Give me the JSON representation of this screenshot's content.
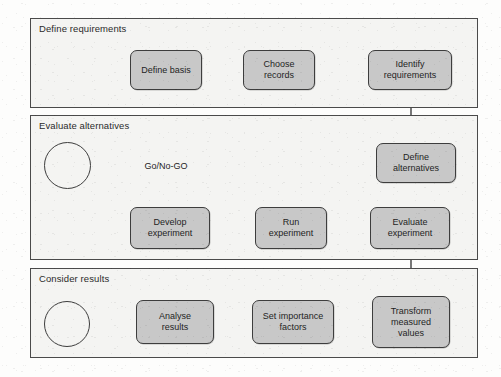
{
  "diagram": {
    "colors": {
      "node_fill": "#c8c8c8",
      "node_stroke": "#3d3d3d",
      "section_fill": "#f4f4f2",
      "section_stroke": "#4a4a4a",
      "arrow": "#1f1f1f",
      "page_background": "#fdfdfc"
    },
    "sections": [
      {
        "id": "define-requirements",
        "label": "Define requirements",
        "x": 30,
        "y": 18,
        "width": 448,
        "height": 90
      },
      {
        "id": "evaluate-alternatives",
        "label": "Evaluate alternatives",
        "x": 30,
        "y": 115,
        "width": 448,
        "height": 145
      },
      {
        "id": "consider-results",
        "label": "Consider results",
        "x": 30,
        "y": 268,
        "width": 448,
        "height": 90
      }
    ],
    "nodes": [
      {
        "id": "start-triangle",
        "shape": "triangle",
        "label": "",
        "x": 46,
        "y": 50,
        "width": 52,
        "height": 40
      },
      {
        "id": "define-basis",
        "shape": "process",
        "label": "Define basis",
        "x": 130,
        "y": 50,
        "width": 72,
        "height": 40
      },
      {
        "id": "choose-records",
        "shape": "process",
        "label": "Choose\nrecords",
        "x": 243,
        "y": 50,
        "width": 72,
        "height": 40
      },
      {
        "id": "identify-requirements",
        "shape": "process",
        "label": "Identify\nrequirements",
        "x": 368,
        "y": 50,
        "width": 84,
        "height": 40
      },
      {
        "id": "end-circle-evaluate",
        "shape": "circle",
        "label": "",
        "x": 44,
        "y": 142,
        "width": 47,
        "height": 47
      },
      {
        "id": "go-no-go",
        "shape": "decision",
        "label": "Go/No-GO",
        "x": 118,
        "y": 140,
        "width": 96,
        "height": 52
      },
      {
        "id": "define-alternatives",
        "shape": "process",
        "label": "Define\nalternatives",
        "x": 376,
        "y": 143,
        "width": 80,
        "height": 40
      },
      {
        "id": "develop-experiment",
        "shape": "process",
        "label": "Develop\nexperiment",
        "x": 130,
        "y": 207,
        "width": 80,
        "height": 42
      },
      {
        "id": "run-experiment",
        "shape": "process",
        "label": "Run\nexperiment",
        "x": 255,
        "y": 207,
        "width": 72,
        "height": 42
      },
      {
        "id": "evaluate-experiment",
        "shape": "process",
        "label": "Evaluate\nexperiment",
        "x": 370,
        "y": 207,
        "width": 80,
        "height": 42
      },
      {
        "id": "end-circle-results",
        "shape": "circle",
        "label": "",
        "x": 44,
        "y": 301,
        "width": 46,
        "height": 46
      },
      {
        "id": "analyse-results",
        "shape": "process",
        "label": "Analyse\nresults",
        "x": 136,
        "y": 300,
        "width": 78,
        "height": 44
      },
      {
        "id": "set-importance-factors",
        "shape": "process",
        "label": "Set importance\nfactors",
        "x": 252,
        "y": 300,
        "width": 82,
        "height": 44
      },
      {
        "id": "transform-measured-values",
        "shape": "process",
        "label": "Transform\nmeasured\nvalues",
        "x": 372,
        "y": 296,
        "width": 78,
        "height": 52
      }
    ],
    "connectors": [
      {
        "id": "start-to-define-basis",
        "from": "start-triangle",
        "to": "define-basis"
      },
      {
        "id": "define-basis-to-choose-records",
        "from": "define-basis",
        "to": "choose-records"
      },
      {
        "id": "choose-records-to-identify-requirements",
        "from": "choose-records",
        "to": "identify-requirements"
      },
      {
        "id": "identify-requirements-to-define-alternatives",
        "from": "identify-requirements",
        "to": "define-alternatives"
      },
      {
        "id": "define-alternatives-to-go-no-go",
        "from": "define-alternatives",
        "to": "go-no-go"
      },
      {
        "id": "go-no-go-to-end-circle",
        "from": "go-no-go",
        "to": "end-circle-evaluate"
      },
      {
        "id": "go-no-go-to-develop-experiment",
        "from": "go-no-go",
        "to": "develop-experiment"
      },
      {
        "id": "develop-to-run-experiment",
        "from": "develop-experiment",
        "to": "run-experiment"
      },
      {
        "id": "run-to-evaluate-experiment",
        "from": "run-experiment",
        "to": "evaluate-experiment"
      },
      {
        "id": "evaluate-experiment-to-transform",
        "from": "evaluate-experiment",
        "to": "transform-measured-values"
      },
      {
        "id": "transform-to-set-importance",
        "from": "transform-measured-values",
        "to": "set-importance-factors"
      },
      {
        "id": "set-importance-to-analyse",
        "from": "set-importance-factors",
        "to": "analyse-results"
      },
      {
        "id": "analyse-to-end-circle",
        "from": "analyse-results",
        "to": "end-circle-results"
      }
    ]
  }
}
